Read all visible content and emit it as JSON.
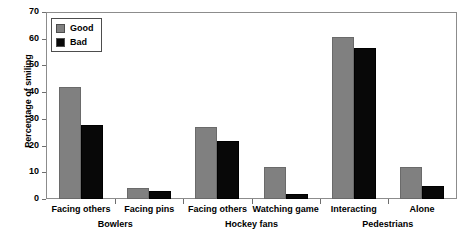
{
  "chart_data": {
    "type": "bar",
    "title": "",
    "xlabel": "",
    "ylabel": "Percentage of smiling",
    "ylim": [
      0,
      70
    ],
    "yticks": [
      0,
      10,
      20,
      30,
      40,
      50,
      60,
      70
    ],
    "grid": false,
    "legend_position": "top-left",
    "categories": [
      "Facing others",
      "Facing pins",
      "Facing others",
      "Watching game",
      "Interacting",
      "Alone"
    ],
    "supergroups": [
      {
        "label": "Bowlers",
        "categories": [
          "Facing others",
          "Facing pins"
        ]
      },
      {
        "label": "Hockey fans",
        "categories": [
          "Facing others",
          "Watching game"
        ]
      },
      {
        "label": "Pedestrians",
        "categories": [
          "Interacting",
          "Alone"
        ]
      }
    ],
    "series": [
      {
        "name": "Good",
        "color": "#808080",
        "values": [
          42,
          4,
          27,
          12,
          61,
          12
        ]
      },
      {
        "name": "Bad",
        "color": "#080808",
        "values": [
          28,
          3,
          22,
          2,
          57,
          5
        ]
      }
    ]
  },
  "legend": {
    "entries": [
      {
        "label": "Good",
        "swatch": "good"
      },
      {
        "label": "Bad",
        "swatch": "bad"
      }
    ]
  },
  "colors": {
    "good": "#808080",
    "bad": "#080808",
    "axis": "#8c8c8c",
    "background": "#ffffff"
  }
}
